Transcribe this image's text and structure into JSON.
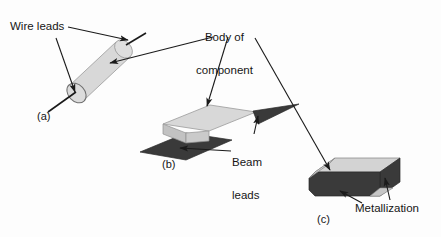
{
  "figure": {
    "background_color": "#fdfdfd",
    "body_fill": "#d8d8d8",
    "body_fill_dark": "#c9c9c9",
    "lead_fill": "#3a3a3a",
    "line_color": "#1a1a1a"
  },
  "labels": {
    "wire_leads": "Wire leads",
    "body_of_component_line1": "Body of",
    "body_of_component_line2": "component",
    "beam_leads_line1": "Beam",
    "beam_leads_line2": "leads",
    "metallization": "Metallization"
  },
  "panels": [
    {
      "id": "a",
      "caption": "(a)",
      "description": "Axial cylindrical component with wire leads"
    },
    {
      "id": "b",
      "caption": "(b)",
      "description": "Flat package with beam leads"
    },
    {
      "id": "c",
      "caption": "(c)",
      "description": "Chip component with metallization end caps"
    }
  ]
}
